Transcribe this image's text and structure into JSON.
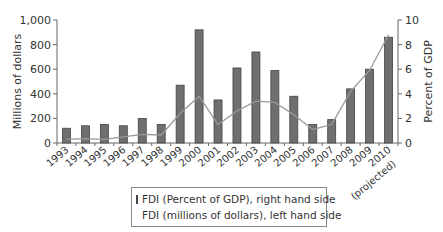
{
  "chart_data": {
    "type": "bar",
    "title": "",
    "categories": [
      "1993",
      "1994",
      "1995",
      "1996",
      "1997",
      "1998",
      "1999",
      "2000",
      "2001",
      "2002",
      "2003",
      "2004",
      "2005",
      "2006",
      "2007",
      "2008",
      "2009",
      "2010"
    ],
    "category_note": "2010 (projected)",
    "xlabel": "",
    "ylabel_left": "Millions of dollars",
    "ylabel_right": "Percent of GDP",
    "ylim_left": [
      0,
      1000
    ],
    "ylim_right": [
      0,
      10
    ],
    "yticks_left": [
      "0",
      "200",
      "400",
      "600",
      "800",
      "1,000"
    ],
    "yticks_right": [
      "0",
      "2",
      "4",
      "6",
      "8",
      "10"
    ],
    "grid": false,
    "legend_position": "bottom-center",
    "series": [
      {
        "name": "FDI (Percent of GDP), right hand side",
        "type": "bar",
        "axis": "right",
        "color": "#6f6f6f",
        "values": [
          1.2,
          1.4,
          1.5,
          1.4,
          2.0,
          1.5,
          4.7,
          9.2,
          3.5,
          6.1,
          7.4,
          5.9,
          3.8,
          1.5,
          1.9,
          4.4,
          6.0,
          8.6
        ]
      },
      {
        "name": "FDI (millions of dollars), left hand side",
        "type": "line",
        "axis": "left",
        "color": "#999999",
        "values": [
          30,
          35,
          30,
          50,
          70,
          65,
          240,
          380,
          150,
          260,
          340,
          330,
          230,
          110,
          150,
          420,
          590,
          880
        ]
      }
    ]
  },
  "legend": {
    "bar_label": "FDI (Percent of GDP), right hand side",
    "line_label": "FDI (millions of dollars), left hand side"
  },
  "projected_label": "(projected)"
}
